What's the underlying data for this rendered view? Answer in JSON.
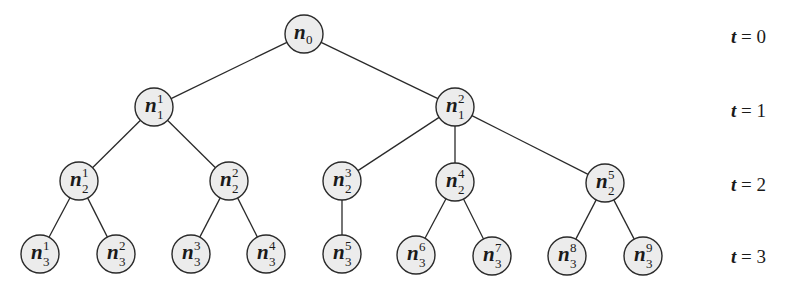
{
  "diagram": {
    "node_radius": 19,
    "nodes": [
      {
        "id": "n0",
        "base": "n",
        "sub": "0",
        "sup": "",
        "x": 304,
        "y": 34,
        "level": 0
      },
      {
        "id": "n1_1",
        "base": "n",
        "sub": "1",
        "sup": "1",
        "x": 154,
        "y": 107,
        "level": 1
      },
      {
        "id": "n1_2",
        "base": "n",
        "sub": "1",
        "sup": "2",
        "x": 455,
        "y": 107,
        "level": 1
      },
      {
        "id": "n2_1",
        "base": "n",
        "sub": "2",
        "sup": "1",
        "x": 79,
        "y": 181,
        "level": 2
      },
      {
        "id": "n2_2",
        "base": "n",
        "sub": "2",
        "sup": "2",
        "x": 229,
        "y": 181,
        "level": 2
      },
      {
        "id": "n2_3",
        "base": "n",
        "sub": "2",
        "sup": "3",
        "x": 342,
        "y": 181,
        "level": 2
      },
      {
        "id": "n2_4",
        "base": "n",
        "sub": "2",
        "sup": "4",
        "x": 455,
        "y": 182,
        "level": 2
      },
      {
        "id": "n2_5",
        "base": "n",
        "sub": "2",
        "sup": "5",
        "x": 605,
        "y": 183,
        "level": 2
      },
      {
        "id": "n3_1",
        "base": "n",
        "sub": "3",
        "sup": "1",
        "x": 40,
        "y": 254,
        "level": 3
      },
      {
        "id": "n3_2",
        "base": "n",
        "sub": "3",
        "sup": "2",
        "x": 116,
        "y": 254,
        "level": 3
      },
      {
        "id": "n3_3",
        "base": "n",
        "sub": "3",
        "sup": "3",
        "x": 191,
        "y": 254,
        "level": 3
      },
      {
        "id": "n3_4",
        "base": "n",
        "sub": "3",
        "sup": "4",
        "x": 266,
        "y": 254,
        "level": 3
      },
      {
        "id": "n3_5",
        "base": "n",
        "sub": "3",
        "sup": "5",
        "x": 342,
        "y": 254,
        "level": 3
      },
      {
        "id": "n3_6",
        "base": "n",
        "sub": "3",
        "sup": "6",
        "x": 416,
        "y": 255,
        "level": 3
      },
      {
        "id": "n3_7",
        "base": "n",
        "sub": "3",
        "sup": "7",
        "x": 492,
        "y": 256,
        "level": 3
      },
      {
        "id": "n3_8",
        "base": "n",
        "sub": "3",
        "sup": "8",
        "x": 567,
        "y": 256,
        "level": 3
      },
      {
        "id": "n3_9",
        "base": "n",
        "sub": "3",
        "sup": "9",
        "x": 643,
        "y": 256,
        "level": 3
      }
    ],
    "edges": [
      [
        "n0",
        "n1_1"
      ],
      [
        "n0",
        "n1_2"
      ],
      [
        "n1_1",
        "n2_1"
      ],
      [
        "n1_1",
        "n2_2"
      ],
      [
        "n1_2",
        "n2_3"
      ],
      [
        "n1_2",
        "n2_4"
      ],
      [
        "n1_2",
        "n2_5"
      ],
      [
        "n2_1",
        "n3_1"
      ],
      [
        "n2_1",
        "n3_2"
      ],
      [
        "n2_2",
        "n3_3"
      ],
      [
        "n2_2",
        "n3_4"
      ],
      [
        "n2_3",
        "n3_5"
      ],
      [
        "n2_4",
        "n3_6"
      ],
      [
        "n2_4",
        "n3_7"
      ],
      [
        "n2_5",
        "n3_8"
      ],
      [
        "n2_5",
        "n3_9"
      ]
    ],
    "time_labels": [
      {
        "var": "t",
        "eq": " = ",
        "value": "0",
        "y": 38
      },
      {
        "var": "t",
        "eq": " = ",
        "value": "1",
        "y": 112
      },
      {
        "var": "t",
        "eq": " = ",
        "value": "2",
        "y": 186
      },
      {
        "var": "t",
        "eq": " = ",
        "value": "3",
        "y": 258
      }
    ],
    "colors": {
      "node_fill": "#ececec",
      "stroke": "#2a2a2a",
      "text": "#1a1a1a",
      "background": "#ffffff"
    }
  }
}
